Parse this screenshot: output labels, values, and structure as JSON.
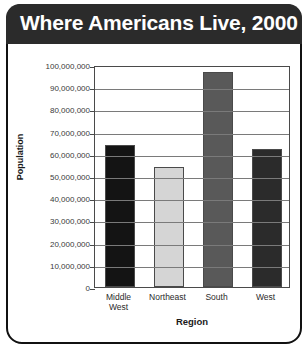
{
  "chart_data": {
    "type": "bar",
    "title": "Where Americans Live, 2000",
    "xlabel": "Region",
    "ylabel": "Population",
    "categories": [
      "Middle West",
      "Northeast",
      "South",
      "West"
    ],
    "values": [
      64000000,
      54000000,
      97000000,
      62000000
    ],
    "series": [
      {
        "name": "Population",
        "values": [
          64000000,
          54000000,
          97000000,
          62000000
        ]
      }
    ],
    "bar_colors": [
      "#141414",
      "#d5d5d5",
      "#595959",
      "#2b2b2b"
    ],
    "ylim": [
      0,
      100000000
    ],
    "ytick_values": [
      0,
      10000000,
      20000000,
      30000000,
      40000000,
      50000000,
      60000000,
      70000000,
      80000000,
      90000000,
      100000000
    ],
    "ytick_labels": [
      "0",
      "10,000,000",
      "20,000,000",
      "30,000,000",
      "40,000,000",
      "50,000,000",
      "60,000,000",
      "70,000,000",
      "80,000,000",
      "90,000,000",
      "100,000,000"
    ],
    "xtick_labels": [
      "Middle\nWest",
      "Northeast",
      "South",
      "West"
    ],
    "grid": true,
    "legend": "none"
  },
  "style": {
    "title_band_color": "#2b2b2b",
    "title_text_color": "#ffffff",
    "frame_color": "#111111",
    "grid_color": "#7a7a7a",
    "axis_color": "#4a4a4a"
  }
}
